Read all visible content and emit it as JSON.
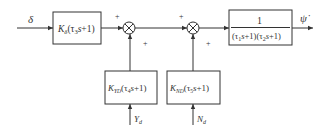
{
  "diagram": {
    "type": "block_diagram",
    "input": {
      "symbol": "δ"
    },
    "output": {
      "symbol": "ψ̇"
    },
    "blocks": [
      {
        "id": "rudder",
        "gain": "K",
        "gain_sub": "δ",
        "tau": "τ",
        "tau_sub": "3",
        "tail": "s+1)"
      },
      {
        "id": "plant",
        "numerator": "1",
        "denominator_a": "(τ",
        "sub1": "1",
        "mid": "s+1)(τ",
        "sub2": "2",
        "end": "s+1)"
      },
      {
        "id": "yd",
        "gain": "K",
        "gain_sub": "YD",
        "tau": "τ",
        "tau_sub": "4",
        "tail": "s+1)"
      },
      {
        "id": "nd",
        "gain": "K",
        "gain_sub": "ND",
        "tau": "τ",
        "tau_sub": "5",
        "tail": "s+1)"
      }
    ],
    "summing_junctions": [
      {
        "id": "sum1",
        "signs": [
          "+",
          "+"
        ]
      },
      {
        "id": "sum2",
        "signs": [
          "+",
          "+"
        ]
      }
    ],
    "disturbances": [
      {
        "symbol": "Y",
        "sub": "d"
      },
      {
        "symbol": "N",
        "sub": "d"
      }
    ]
  }
}
